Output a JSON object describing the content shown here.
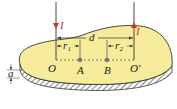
{
  "diagram": {
    "labels": {
      "O": "O",
      "A": "A",
      "B": "B",
      "O_prime": "O′",
      "d": "d",
      "r1": "r₁",
      "r2": "r₂",
      "a": "a",
      "I_left": "I",
      "I_right": "I"
    },
    "colors": {
      "plate_fill": "#f7ec9c",
      "outline": "#333333",
      "wire": "#333333",
      "current_arrow": "#d8302a",
      "point": "#777777"
    }
  }
}
